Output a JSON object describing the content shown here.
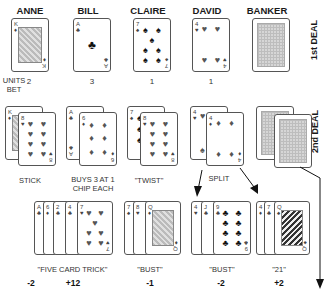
{
  "players": [
    {
      "name": "ANNE",
      "units_bet": "2"
    },
    {
      "name": "BILL",
      "units_bet": "3"
    },
    {
      "name": "CLAIRE",
      "units_bet": "1"
    },
    {
      "name": "DAVID",
      "units_bet": "1"
    },
    {
      "name": "BANKER",
      "units_bet": ""
    }
  ],
  "units_bet_label": "UNITS\nBET",
  "deal_labels": {
    "first": "1st DEAL",
    "second": "2nd DEAL"
  },
  "first_deal_cards": {
    "anne": {
      "rank": "K",
      "suit": "♦",
      "face": true
    },
    "bill": {
      "rank": "A",
      "suit": "♣"
    },
    "claire": {
      "rank": "7",
      "suit": "♠"
    },
    "david": {
      "rank": "4",
      "suit": "♥"
    },
    "banker": {
      "back": true
    }
  },
  "second_deal": {
    "anne": {
      "cards": [
        "K♦",
        "8♥"
      ],
      "label": "STICK"
    },
    "bill": {
      "cards": [
        "A♣",
        "6♦"
      ],
      "label": "BUYS 3 AT 1\nCHIP EACH"
    },
    "claire": {
      "cards": [
        "7♠",
        "8♥"
      ],
      "label": "\"TWIST\""
    },
    "david": {
      "cards": [
        "4♥",
        "4♦"
      ],
      "label": "SPLIT"
    },
    "banker": {
      "cards": [
        "back",
        "back"
      ]
    }
  },
  "outcomes": [
    {
      "cards": [
        "A♣",
        "6♦",
        "2♣",
        "4♣",
        "7♥"
      ],
      "label": "\"FIVE CARD TRICK\"",
      "scores": [
        "-2",
        "+12"
      ]
    },
    {
      "cards": [
        "7♠",
        "8♥",
        "Q♦"
      ],
      "label": "\"BUST\"",
      "scores": [
        "-1"
      ]
    },
    {
      "cards": [
        "4♥",
        "J♣",
        "9♣"
      ],
      "label": "\"BUST\"",
      "scores": [
        "-2"
      ]
    },
    {
      "cards": [
        "4♦",
        "7♣",
        "Q♠"
      ],
      "label": "\"21\"",
      "scores": [
        "+2"
      ]
    }
  ]
}
